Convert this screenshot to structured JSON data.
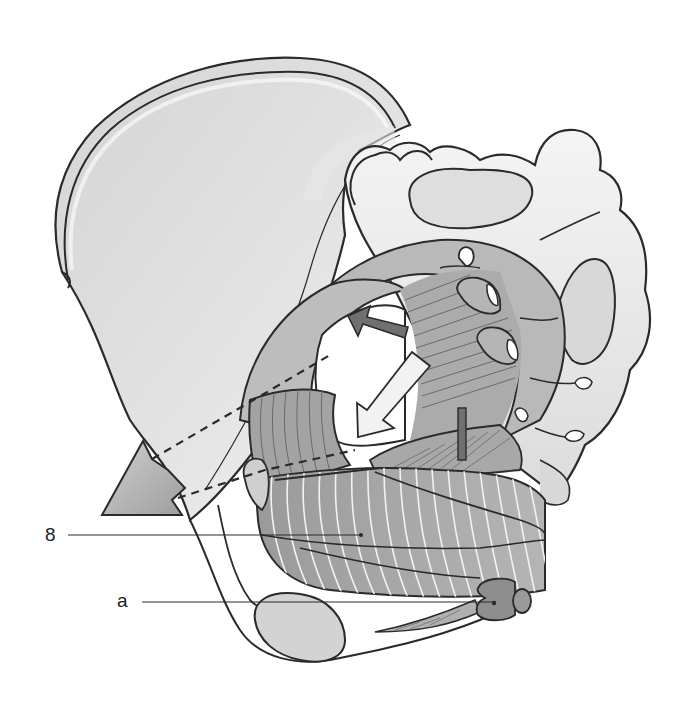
{
  "figure": {
    "colors": {
      "background": "#ffffff",
      "outline": "#2a2a2a",
      "bone_light": "#eeeeee",
      "bone_shade": "#cfcfcf",
      "muscle": "#a9a9a9",
      "muscle_dark": "#8f8f8f",
      "arrow_dark": "#6f6f6f",
      "arrow_light": "#f2f2f2"
    }
  },
  "labels": [
    {
      "id": "label-8",
      "text": "8"
    },
    {
      "id": "label-a",
      "text": "a"
    }
  ]
}
